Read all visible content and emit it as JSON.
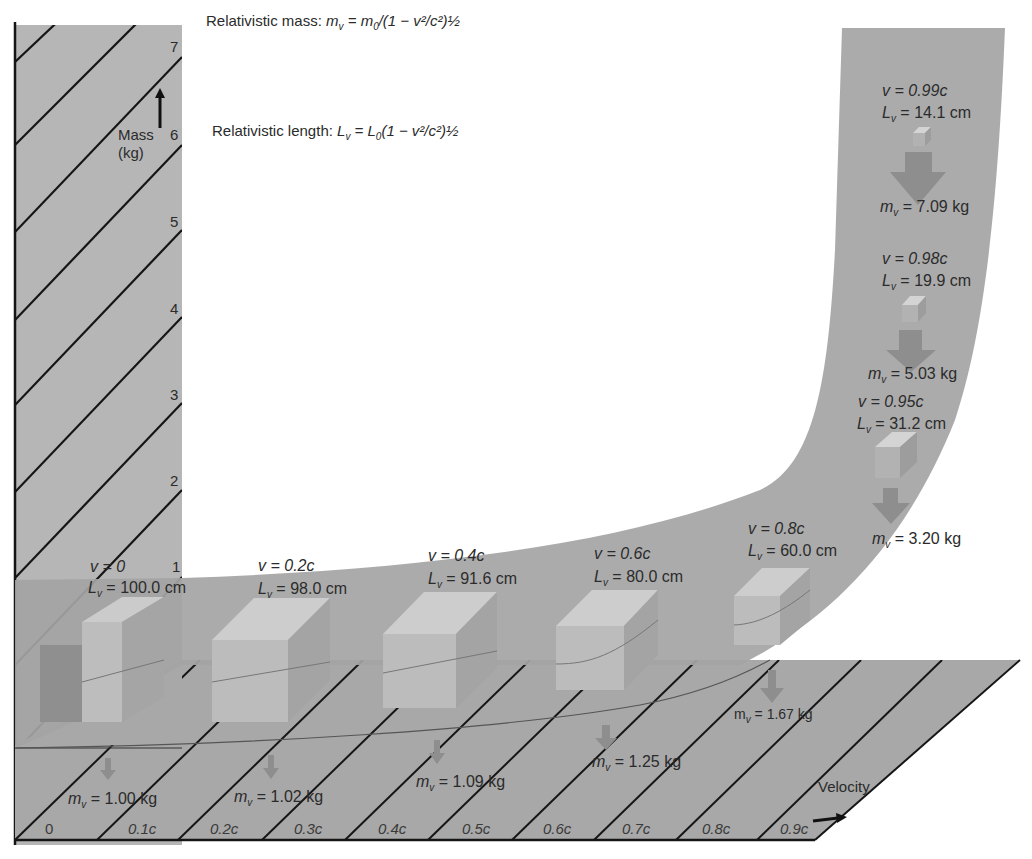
{
  "formulas": {
    "mass_label": "Relativistic mass: ",
    "mass_lhs": "m",
    "mass_sub": "v",
    "mass_rhs": " = m",
    "mass_rhs_sub": "0",
    "mass_tail": "/(1 − v²/c²)½",
    "length_label": "Relativistic length: ",
    "length_lhs": "L",
    "length_sub": "v",
    "length_rhs": " = L",
    "length_rhs_sub": "0",
    "length_tail": "(1 − v²/c²)½"
  },
  "y_axis": {
    "label_line1": "Mass",
    "label_line2": "(kg)",
    "ticks": [
      "7",
      "6",
      "5",
      "4",
      "3",
      "2",
      "1"
    ],
    "arrow_icon": "up-arrow"
  },
  "x_axis": {
    "label": "Velocity",
    "ticks": [
      "0",
      "0.1c",
      "0.2c",
      "0.3c",
      "0.4c",
      "0.5c",
      "0.6c",
      "0.7c",
      "0.8c",
      "0.9c"
    ],
    "arrow_icon": "right-arrow"
  },
  "blocks": [
    {
      "v": "v = 0",
      "L": "L",
      "Lval": " = 100.0 cm",
      "m": " = 1.00 kg"
    },
    {
      "v": "v = 0.2c",
      "L": "L",
      "Lval": " = 98.0 cm",
      "m": " = 1.02 kg"
    },
    {
      "v": "v = 0.4c",
      "L": "L",
      "Lval": " = 91.6 cm",
      "m": " = 1.09 kg"
    },
    {
      "v": "v = 0.6c",
      "L": "L",
      "Lval": " = 80.0 cm",
      "m": " = 1.25 kg"
    },
    {
      "v": "v = 0.8c",
      "L": "L",
      "Lval": " = 60.0 cm",
      "m": " = 1.67 kg"
    },
    {
      "v": "v = 0.95c",
      "L": "L",
      "Lval": " = 31.2 cm",
      "m": " = 3.20 kg"
    },
    {
      "v": "v = 0.98c",
      "L": "L",
      "Lval": " = 19.9 cm",
      "m": " = 5.03 kg"
    },
    {
      "v": "v = 0.99c",
      "L": "L",
      "Lval": " = 14.1 cm",
      "m": " = 7.09 kg"
    }
  ],
  "mass_symbol": "m",
  "sub_v": "v",
  "colors": {
    "panel": "#b4b4b4",
    "floor": "#a9a9a9",
    "band": "#a6a6a6",
    "block_top": "#cfcfcf",
    "block_front": "#bdbdbd",
    "block_side": "#a3a3a3",
    "arrow": "#8f8f8f",
    "line": "#1a1a1a"
  }
}
